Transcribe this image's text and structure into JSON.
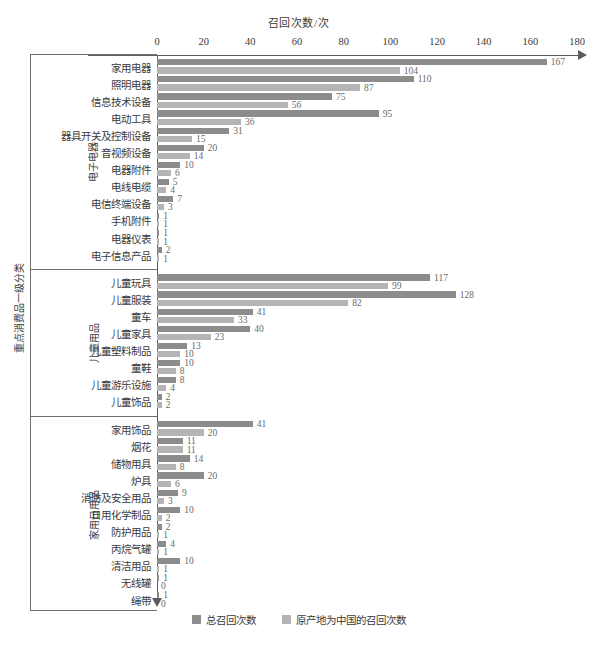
{
  "chart_data": {
    "type": "bar",
    "orientation": "horizontal",
    "title": "召回次数/次",
    "xlabel": "召回次数/次",
    "ylabel": "重点消费品一级分类",
    "xlim": [
      0,
      180
    ],
    "xticks": [
      0,
      20,
      40,
      60,
      80,
      100,
      120,
      140,
      160,
      180
    ],
    "grid": false,
    "legend_position": "bottom-center",
    "series": [
      {
        "name": "总召回次数",
        "color": "#8c8c8c"
      },
      {
        "name": "原产地为中国的召回次数",
        "color": "#b4b4b4"
      }
    ],
    "groups": [
      {
        "name": "电子电器",
        "categories": [
          "家用电器",
          "照明电器",
          "信息技术设备",
          "电动工具",
          "器具开关及控制设备",
          "音视频设备",
          "电器附件",
          "电线电缆",
          "电信终端设备",
          "手机附件",
          "电器仪表",
          "电子信息产品"
        ],
        "total": [
          167,
          110,
          75,
          95,
          31,
          20,
          10,
          5,
          7,
          1,
          1,
          2
        ],
        "china": [
          104,
          87,
          56,
          36,
          15,
          14,
          6,
          4,
          3,
          1,
          1,
          1
        ]
      },
      {
        "name": "儿童用品",
        "categories": [
          "儿童玩具",
          "儿童服装",
          "童车",
          "儿童家具",
          "儿童塑料制品",
          "童鞋",
          "儿童游乐设施",
          "儿童饰品"
        ],
        "total": [
          117,
          128,
          41,
          40,
          13,
          10,
          8,
          2
        ],
        "china": [
          99,
          82,
          33,
          23,
          10,
          8,
          4,
          2
        ]
      },
      {
        "name": "家用日用品",
        "categories": [
          "家用饰品",
          "烟花",
          "储物用具",
          "炉具",
          "消防及安全用品",
          "日用化学制品",
          "防护用品",
          "丙烷气罐",
          "清洁用品",
          "无线罐",
          "绳带"
        ],
        "total": [
          41,
          11,
          14,
          20,
          9,
          10,
          2,
          4,
          10,
          1,
          1
        ],
        "china": [
          20,
          11,
          8,
          6,
          3,
          2,
          1,
          1,
          1,
          0,
          0
        ]
      }
    ]
  },
  "legend": {
    "items": [
      {
        "label": "总召回次数",
        "color": "#8c8c8c"
      },
      {
        "label": "原产地为中国的召回次数",
        "color": "#b4b4b4"
      }
    ]
  }
}
